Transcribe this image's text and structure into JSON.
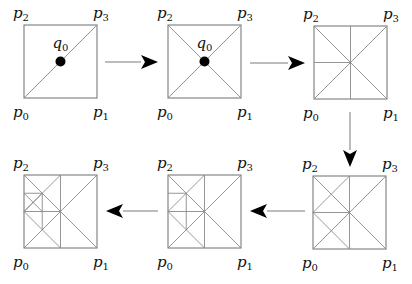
{
  "diagram": {
    "square_size": 73,
    "colors": {
      "edge": "#8a8a8a",
      "arrow": "#000000",
      "point": "#000000"
    },
    "corner_labels": {
      "p0": {
        "base": "p",
        "sub": "0"
      },
      "p1": {
        "base": "p",
        "sub": "1"
      },
      "p2": {
        "base": "p",
        "sub": "2"
      },
      "p3": {
        "base": "p",
        "sub": "3"
      }
    },
    "point_label": {
      "base": "q",
      "sub": "0"
    },
    "panels": [
      {
        "id": "step-1",
        "x": 24,
        "y": 25,
        "show_point": true,
        "lines": [
          [
            0,
            1,
            1,
            0
          ]
        ]
      },
      {
        "id": "step-2",
        "x": 168,
        "y": 25,
        "show_point": true,
        "lines": [
          [
            0,
            1,
            1,
            0
          ],
          [
            0,
            0,
            1,
            1
          ]
        ]
      },
      {
        "id": "step-3",
        "x": 314,
        "y": 26,
        "show_point": false,
        "lines": [
          [
            0,
            1,
            1,
            0
          ],
          [
            0,
            0,
            1,
            1
          ],
          [
            0.5,
            0,
            0.5,
            1
          ],
          [
            0,
            0.5,
            0.5,
            0.5
          ]
        ]
      },
      {
        "id": "step-4",
        "x": 313,
        "y": 176,
        "show_point": false,
        "lines": [
          [
            0,
            1,
            1,
            0
          ],
          [
            0,
            0,
            1,
            1
          ],
          [
            0.5,
            0,
            0.5,
            1
          ],
          [
            0,
            0.5,
            0.5,
            0.5
          ],
          [
            0,
            0.5,
            0.5,
            0
          ],
          [
            0,
            0.5,
            0.5,
            1
          ]
        ]
      },
      {
        "id": "step-5",
        "x": 168,
        "y": 175,
        "show_point": false,
        "lines": [
          [
            0,
            1,
            1,
            0
          ],
          [
            0,
            0,
            1,
            1
          ],
          [
            0.5,
            0,
            0.5,
            1
          ],
          [
            0,
            0.5,
            0.5,
            0.5
          ],
          [
            0,
            0.5,
            0.5,
            0
          ],
          [
            0,
            0.5,
            0.5,
            1
          ],
          [
            0.25,
            0.25,
            0.25,
            0.75
          ],
          [
            0,
            0.25,
            0.25,
            0.25
          ]
        ]
      },
      {
        "id": "step-6",
        "x": 24,
        "y": 175,
        "show_point": false,
        "lines": [
          [
            0,
            1,
            1,
            0
          ],
          [
            0,
            0,
            1,
            1
          ],
          [
            0.5,
            0,
            0.5,
            1
          ],
          [
            0,
            0.5,
            0.5,
            0.5
          ],
          [
            0,
            0.5,
            0.5,
            0
          ],
          [
            0,
            0.5,
            0.5,
            1
          ],
          [
            0.25,
            0.25,
            0.25,
            0.75
          ],
          [
            0,
            0.25,
            0.25,
            0.25
          ],
          [
            0,
            0.25,
            0.25,
            0.5
          ],
          [
            0,
            0.5,
            0.25,
            0.25
          ]
        ]
      }
    ],
    "arrows": [
      {
        "id": "arrow-1-to-2",
        "x1": 105,
        "y1": 62,
        "x2": 158,
        "y2": 62
      },
      {
        "id": "arrow-2-to-3",
        "x1": 250,
        "y1": 63,
        "x2": 305,
        "y2": 63
      },
      {
        "id": "arrow-3-to-4",
        "x1": 350,
        "y1": 112,
        "x2": 350,
        "y2": 167
      },
      {
        "id": "arrow-4-to-5",
        "x1": 305,
        "y1": 211,
        "x2": 250,
        "y2": 211
      },
      {
        "id": "arrow-5-to-6",
        "x1": 158,
        "y1": 211,
        "x2": 106,
        "y2": 211
      }
    ]
  }
}
